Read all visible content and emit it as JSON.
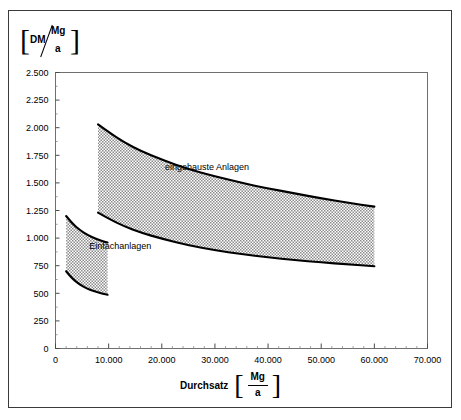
{
  "figure": {
    "y_unit": {
      "bracket_open": "[",
      "numerator": "DM",
      "den_top": "Mg",
      "den_bottom": "a",
      "bracket_close": "]"
    },
    "x_title": {
      "word": "Durchsatz",
      "bracket_open": "[",
      "numerator": "Mg",
      "denominator": "a",
      "bracket_close": "]"
    }
  },
  "chart_data": {
    "type": "area",
    "title": "",
    "subtitle": "",
    "xlabel": "Durchsatz [Mg/a]",
    "ylabel": "[DM/(Mg/a)]",
    "xlim": [
      0,
      70000
    ],
    "ylim": [
      0,
      2500
    ],
    "xticks": [
      0,
      10000,
      20000,
      30000,
      40000,
      50000,
      60000,
      70000
    ],
    "xtick_labels": [
      "0",
      "10.000",
      "20.000",
      "30.000",
      "40.000",
      "50.000",
      "60.000",
      "70.000"
    ],
    "x_minor_step": 2000,
    "yticks": [
      0,
      250,
      500,
      750,
      1000,
      1250,
      1500,
      1750,
      2000,
      2250,
      2500
    ],
    "ytick_labels": [
      "0",
      "250",
      "500",
      "750",
      "1.000",
      "1.250",
      "1.500",
      "1.750",
      "2.000",
      "2.250",
      "2.500"
    ],
    "y_minor_step": 125,
    "grid": false,
    "legend_position": "inline-annotations",
    "fill_style": "stipple-hatch",
    "fill_color": "#9a9a9a",
    "line_color": "#000000",
    "series": [
      {
        "name": "eingehauste Anlagen",
        "annotation": "eingehauste Anlagen",
        "annotation_xy": [
          28500,
          1620
        ],
        "x_range": [
          8000,
          60000
        ],
        "upper": {
          "x": [
            8000,
            10000,
            13000,
            16000,
            20000,
            25000,
            30000,
            35000,
            40000,
            45000,
            50000,
            55000,
            60000
          ],
          "y": [
            2030,
            1960,
            1865,
            1790,
            1710,
            1625,
            1560,
            1500,
            1450,
            1405,
            1360,
            1320,
            1285
          ]
        },
        "lower": {
          "x": [
            8000,
            10000,
            13000,
            16000,
            20000,
            25000,
            30000,
            35000,
            40000,
            45000,
            50000,
            55000,
            60000
          ],
          "y": [
            1230,
            1175,
            1105,
            1050,
            995,
            935,
            890,
            855,
            825,
            800,
            780,
            762,
            745
          ]
        }
      },
      {
        "name": "Einfachanlagen",
        "annotation": "Einfachanlagen",
        "annotation_xy": [
          12200,
          905
        ],
        "x_range": [
          2000,
          9800
        ],
        "upper": {
          "x": [
            2000,
            3000,
            4500,
            6000,
            7500,
            9000,
            9800
          ],
          "y": [
            1200,
            1140,
            1075,
            1030,
            995,
            970,
            960
          ]
        },
        "lower": {
          "x": [
            2000,
            3000,
            4500,
            6000,
            7500,
            9000,
            9800
          ],
          "y": [
            700,
            640,
            580,
            540,
            515,
            495,
            487
          ]
        }
      }
    ]
  }
}
